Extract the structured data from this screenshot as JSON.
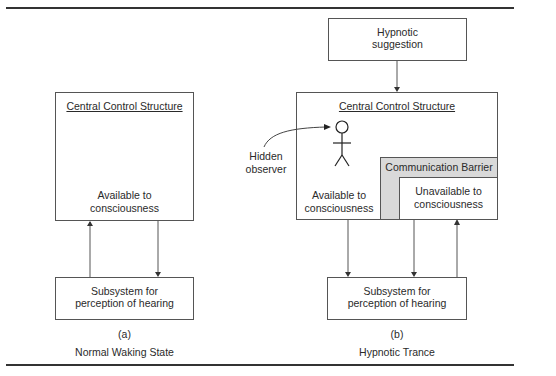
{
  "diagram": {
    "panel_a": {
      "central_box": {
        "title": "Central Control Structure",
        "line1": "Available to",
        "line2": "consciousness"
      },
      "subsystem": {
        "line1": "Subsystem for",
        "line2": "perception of hearing"
      },
      "caption_letter": "(a)",
      "caption": "Normal Waking State"
    },
    "panel_b": {
      "input_box": {
        "line1": "Hypnotic",
        "line2": "suggestion"
      },
      "central_box": {
        "title": "Central Control Structure",
        "available_line1": "Available to",
        "available_line2": "consciousness",
        "barrier_label": "Communication Barrier",
        "unavailable_line1": "Unavailable to",
        "unavailable_line2": "consciousness"
      },
      "hidden_observer": {
        "line1": "Hidden",
        "line2": "observer",
        "icon": "stick-figure-icon"
      },
      "subsystem": {
        "line1": "Subsystem for",
        "line2": "perception of hearing"
      },
      "caption_letter": "(b)",
      "caption": "Hypnotic Trance"
    },
    "colors": {
      "line": "#555555",
      "barrier_fill": "#d9d9d9",
      "rule": "#333333"
    }
  }
}
